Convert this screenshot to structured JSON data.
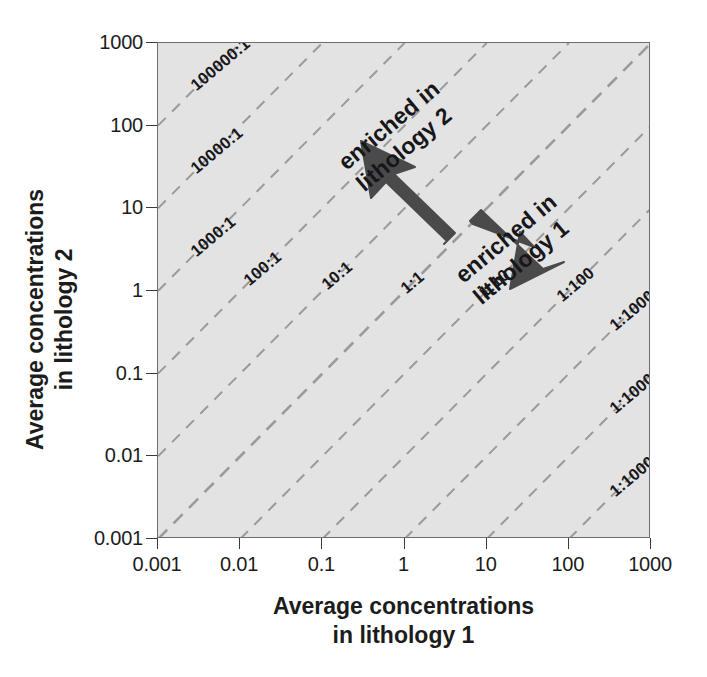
{
  "chart_data": {
    "type": "line",
    "title": "",
    "xlabel": "Average concentrations in lithology 1",
    "ylabel": "Average concentrations in lithology 2",
    "scale": "log-log",
    "xlim": [
      0.001,
      1000
    ],
    "ylim": [
      0.001,
      1000
    ],
    "grid": false,
    "legend": "none",
    "plot_background": "#e3e3e3",
    "line_color": "#9a9a9a",
    "line_style": "dashed",
    "x_ticks": [
      "0.001",
      "0.01",
      "0.1",
      "1",
      "10",
      "100",
      "1000"
    ],
    "y_ticks": [
      "0.001",
      "0.01",
      "0.1",
      "1",
      "10",
      "100",
      "1000"
    ],
    "x_tick_values": [
      0.001,
      0.01,
      0.1,
      1,
      10,
      100,
      1000
    ],
    "y_tick_values": [
      0.001,
      0.01,
      0.1,
      1,
      10,
      100,
      1000
    ],
    "series": [
      {
        "name": "100000:1",
        "ratio": 100000,
        "log_offset": 5,
        "emphasis": false
      },
      {
        "name": "10000:1",
        "ratio": 10000,
        "log_offset": 4,
        "emphasis": false
      },
      {
        "name": "1000:1",
        "ratio": 1000,
        "log_offset": 3,
        "emphasis": false
      },
      {
        "name": "100:1",
        "ratio": 100,
        "log_offset": 2,
        "emphasis": false
      },
      {
        "name": "10:1",
        "ratio": 10,
        "log_offset": 1,
        "emphasis": false
      },
      {
        "name": "1:1",
        "ratio": 1,
        "log_offset": 0,
        "emphasis": true
      },
      {
        "name": "1:10",
        "ratio": 0.1,
        "log_offset": -1,
        "emphasis": false
      },
      {
        "name": "1:100",
        "ratio": 0.01,
        "log_offset": -2,
        "emphasis": false
      },
      {
        "name": "1:1000",
        "ratio": 0.001,
        "log_offset": -3,
        "emphasis": false
      },
      {
        "name": "1:10000",
        "ratio": 0.0001,
        "log_offset": -4,
        "emphasis": false
      },
      {
        "name": "1:100000",
        "ratio": 1e-05,
        "log_offset": -5,
        "emphasis": false
      }
    ],
    "annotations": [
      {
        "id": "enriched-lithology-2",
        "line1": "enriched in",
        "line2": "lithology 2",
        "direction": "up-left",
        "rotation_deg": -40
      },
      {
        "id": "enriched-lithology-1",
        "line1": "enriched in",
        "line2": "lithology 1",
        "direction": "down-right",
        "rotation_deg": -40
      }
    ],
    "arrow": {
      "type": "double-headed",
      "color": "#4a4a4a",
      "orientation_deg": -40,
      "description": "double headed arrow perpendicular to the 1:1 line"
    }
  },
  "axes": {
    "x": {
      "title_line1": "Average concentrations",
      "title_line2": "in lithology 1",
      "ticks": [
        "0.001",
        "0.01",
        "0.1",
        "1",
        "10",
        "100",
        "1000"
      ]
    },
    "y": {
      "title_line1": "Average concentrations",
      "title_line2": "in lithology 2",
      "ticks": [
        "0.001",
        "0.01",
        "0.1",
        "1",
        "10",
        "100",
        "1000"
      ]
    }
  },
  "ratio_labels": [
    "100000:1",
    "10000:1",
    "1000:1",
    "100:1",
    "10:1",
    "1:1",
    "1:10",
    "1:100",
    "1:1000",
    "1:10000",
    "1:100000"
  ],
  "annotation_texts": {
    "up": {
      "line1": "enriched in",
      "line2": "lithology 2"
    },
    "down": {
      "line1": "enriched in",
      "line2": "lithology 1"
    }
  },
  "colors": {
    "plot_background": "#e3e3e3",
    "page_background": "#ffffff",
    "diagonal_line": "#9a9a9a",
    "diagonal_line_emphasis": "#8a8a8a",
    "arrow": "#4a4a4a",
    "text": "#1c1c1c",
    "frame": "#6d6d6d"
  }
}
